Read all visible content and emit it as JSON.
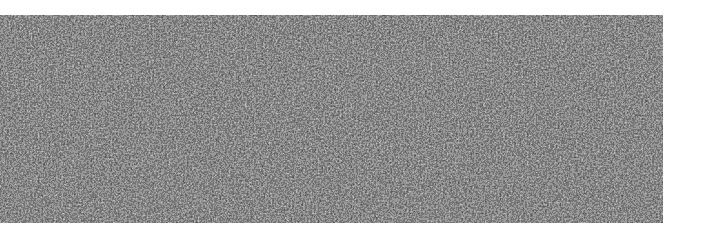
{
  "image": {
    "description": "grayscale random noise texture",
    "background_color": "#ffffff",
    "noise_region": {
      "x": 0,
      "y": 15,
      "width": 663,
      "height": 208,
      "base_color": "#1a1a1a",
      "speckle_color": "#8a8a8a"
    }
  }
}
